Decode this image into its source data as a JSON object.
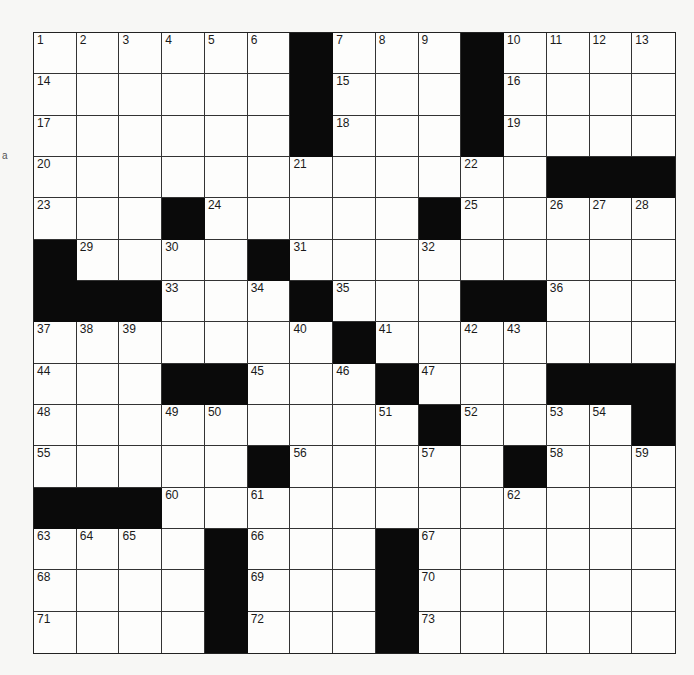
{
  "puzzle": {
    "rows": 15,
    "cols": 15,
    "colors": {
      "black": "#0a0a0a",
      "white": "#fdfdfc",
      "line": "#333333"
    },
    "grid": [
      [
        "1",
        "2",
        "3",
        "4",
        "5",
        "6",
        "#",
        "7",
        "8",
        "9",
        "#",
        "10",
        "11",
        "12",
        "13"
      ],
      [
        "14",
        "",
        "",
        "",
        "",
        "",
        "#",
        "15",
        "",
        "",
        "#",
        "16",
        "",
        "",
        ""
      ],
      [
        "17",
        "",
        "",
        "",
        "",
        "",
        "#",
        "18",
        "",
        "",
        "#",
        "19",
        "",
        "",
        ""
      ],
      [
        "20",
        "",
        "",
        "",
        "",
        "",
        "21",
        "",
        "",
        "",
        "22",
        "",
        "#",
        "#",
        "#"
      ],
      [
        "23",
        "",
        "",
        "#",
        "24",
        "",
        "",
        "",
        "",
        "#",
        "25",
        "",
        "26",
        "27",
        "28"
      ],
      [
        "#",
        "29",
        "",
        "30",
        "",
        "#",
        "31",
        "",
        "",
        "32",
        "",
        "",
        "",
        "",
        ""
      ],
      [
        "#",
        "#",
        "#",
        "33",
        "",
        "34",
        "#",
        "35",
        "",
        "",
        "#",
        "#",
        "36",
        "",
        ""
      ],
      [
        "37",
        "38",
        "39",
        "",
        "",
        "",
        "40",
        "#",
        "41",
        "",
        "42",
        "43",
        "",
        "",
        ""
      ],
      [
        "44",
        "",
        "",
        "#",
        "#",
        "45",
        "",
        "46",
        "#",
        "47",
        "",
        "",
        "#",
        "#",
        "#"
      ],
      [
        "48",
        "",
        "",
        "49",
        "50",
        "",
        "",
        "",
        "51",
        "#",
        "52",
        "",
        "53",
        "54",
        "#"
      ],
      [
        "55",
        "",
        "",
        "",
        "",
        "#",
        "56",
        "",
        "",
        "57",
        "",
        "#",
        "58",
        "",
        "59"
      ],
      [
        "#",
        "#",
        "#",
        "60",
        "",
        "61",
        "",
        "",
        "",
        "",
        "",
        "62",
        "",
        "",
        ""
      ],
      [
        "63",
        "64",
        "65",
        "",
        "#",
        "66",
        "",
        "",
        "#",
        "67",
        "",
        "",
        "",
        "",
        ""
      ],
      [
        "68",
        "",
        "",
        "",
        "#",
        "69",
        "",
        "",
        "#",
        "70",
        "",
        "",
        "",
        "",
        ""
      ],
      [
        "71",
        "",
        "",
        "",
        "#",
        "72",
        "",
        "",
        "#",
        "73",
        "",
        "",
        "",
        "",
        ""
      ]
    ]
  },
  "margin_mark": "a"
}
